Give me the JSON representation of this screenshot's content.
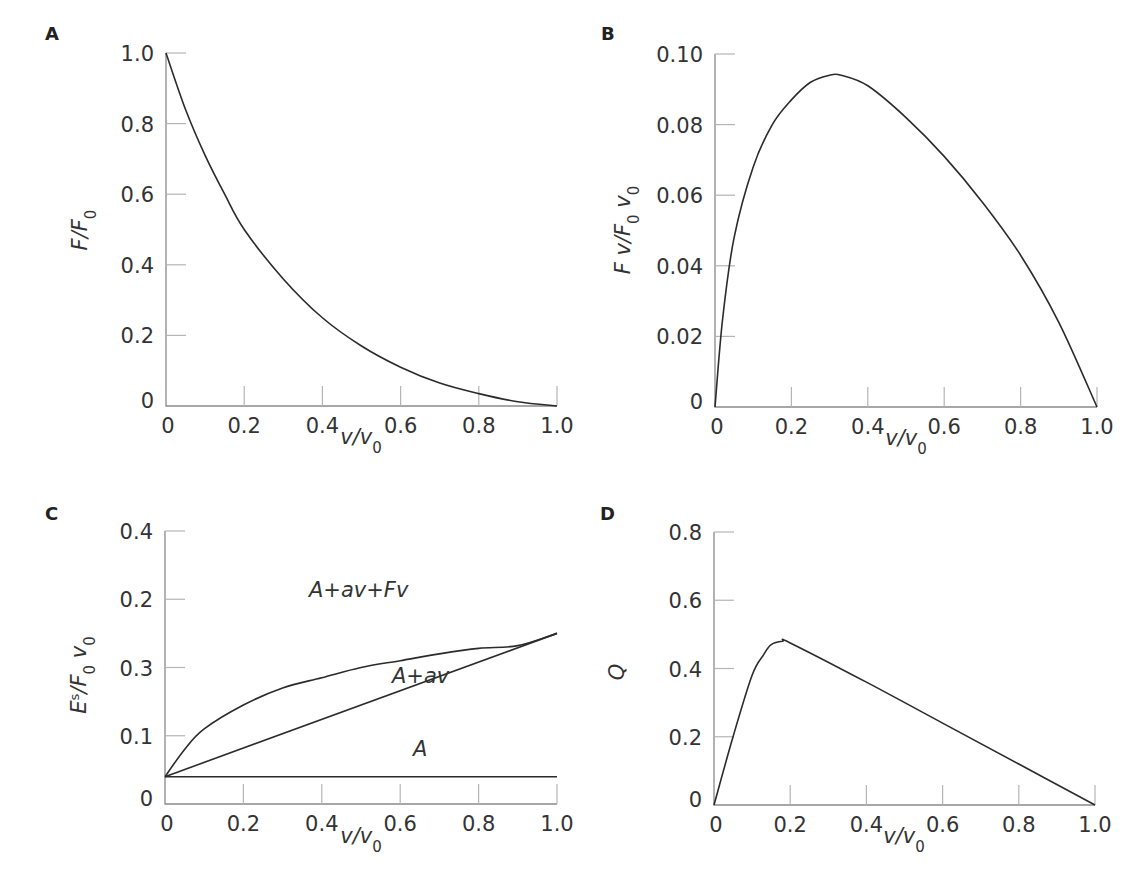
{
  "figure": {
    "panels": [
      {
        "letter": "A",
        "ylabel": "F/F",
        "ylabel_sub": "0",
        "xlabel": "v/v",
        "xlabel_sub": "0",
        "xticks": [
          "0",
          "0.2",
          "0.4",
          "0.6",
          "0.8",
          "1.0"
        ],
        "yticks": [
          "0",
          "0.2",
          "0.4",
          "0.6",
          "0.8",
          "1.0"
        ]
      },
      {
        "letter": "B",
        "ylabel": "F v/F",
        "ylabel_sub": "0",
        "ylabel_tail": " v",
        "ylabel_tail_sub": "0",
        "xlabel": "v/v",
        "xlabel_sub": "0",
        "xticks": [
          "0",
          "0.2",
          "0.4",
          "0.6",
          "0.8",
          "1.0"
        ],
        "yticks": [
          "0",
          "0.02",
          "0.04",
          "0.06",
          "0.08",
          "0.10"
        ]
      },
      {
        "letter": "C",
        "ylabel": "E",
        "ylabel_sup": "s",
        "ylabel_mid": "/F",
        "ylabel_sub": "0",
        "ylabel_tail": " v",
        "ylabel_tail_sub": "0",
        "xlabel": "v/v",
        "xlabel_sub": "0",
        "xticks": [
          "0",
          "0.2",
          "0.4",
          "0.6",
          "0.8",
          "1.0"
        ],
        "yticks": [
          "0",
          "0.1",
          "0.3",
          "0.2",
          "0.4"
        ],
        "curve_labels": [
          "A+av+Fv",
          "A+av",
          "A"
        ]
      },
      {
        "letter": "D",
        "ylabel": "Q",
        "xlabel": "v/v",
        "xlabel_sub": "0",
        "xticks": [
          "0",
          "0.2",
          "0.4",
          "0.6",
          "0.8",
          "1.0"
        ],
        "yticks": [
          "0",
          "0.2",
          "0.4",
          "0.6",
          "0.8"
        ]
      }
    ]
  },
  "chart_data": [
    {
      "panel": "A",
      "type": "line",
      "title": "",
      "xlabel": "v/v0",
      "ylabel": "F/F0",
      "xlim": [
        0,
        1.0
      ],
      "ylim": [
        0,
        1.0
      ],
      "grid": false,
      "series": [
        {
          "name": "F/F0",
          "x": [
            0,
            0.05,
            0.1,
            0.15,
            0.2,
            0.3,
            0.4,
            0.5,
            0.6,
            0.7,
            0.8,
            0.9,
            1.0
          ],
          "y": [
            1.0,
            0.84,
            0.71,
            0.6,
            0.5,
            0.36,
            0.25,
            0.17,
            0.11,
            0.065,
            0.035,
            0.012,
            0
          ]
        }
      ]
    },
    {
      "panel": "B",
      "type": "line",
      "title": "",
      "xlabel": "v/v0",
      "ylabel": "F v/F0 v0",
      "xlim": [
        0,
        1.0
      ],
      "ylim": [
        0,
        0.1
      ],
      "grid": false,
      "series": [
        {
          "name": "Power",
          "x": [
            0,
            0.02,
            0.05,
            0.1,
            0.15,
            0.2,
            0.25,
            0.3,
            0.33,
            0.4,
            0.5,
            0.6,
            0.7,
            0.8,
            0.9,
            1.0
          ],
          "y": [
            0,
            0.025,
            0.048,
            0.068,
            0.08,
            0.087,
            0.092,
            0.094,
            0.094,
            0.091,
            0.082,
            0.071,
            0.058,
            0.043,
            0.024,
            0
          ]
        }
      ]
    },
    {
      "panel": "C",
      "type": "line",
      "title": "",
      "xlabel": "v/v0",
      "ylabel": "Es/F0 v0",
      "xlim": [
        0,
        1.0
      ],
      "ytick_labels": [
        "0",
        "0.1",
        "0.3",
        "0.2",
        "0.4"
      ],
      "grid": false,
      "series": [
        {
          "name": "A+av+Fv",
          "x": [
            0,
            0.05,
            0.1,
            0.2,
            0.3,
            0.4,
            0.5,
            0.6,
            0.7,
            0.8,
            0.9,
            1.0
          ],
          "y": [
            0.04,
            0.08,
            0.11,
            0.145,
            0.17,
            0.185,
            0.2,
            0.21,
            0.22,
            0.228,
            0.232,
            0.25
          ]
        },
        {
          "name": "A+av",
          "x": [
            0,
            1.0
          ],
          "y": [
            0.04,
            0.25
          ]
        },
        {
          "name": "A",
          "x": [
            0,
            1.0
          ],
          "y": [
            0.04,
            0.04
          ]
        }
      ],
      "annotations": [
        "A+av+Fv",
        "A+av",
        "A"
      ]
    },
    {
      "panel": "D",
      "type": "line",
      "title": "",
      "xlabel": "v/v0",
      "ylabel": "Q",
      "xlim": [
        0,
        1.0
      ],
      "ylim": [
        0,
        0.8
      ],
      "grid": false,
      "series": [
        {
          "name": "Q",
          "x": [
            0,
            0.05,
            0.1,
            0.13,
            0.15,
            0.18,
            0.2,
            0.4,
            0.6,
            0.8,
            1.0
          ],
          "y": [
            0,
            0.2,
            0.38,
            0.44,
            0.47,
            0.48,
            0.475,
            0.36,
            0.24,
            0.12,
            0
          ]
        }
      ]
    }
  ]
}
